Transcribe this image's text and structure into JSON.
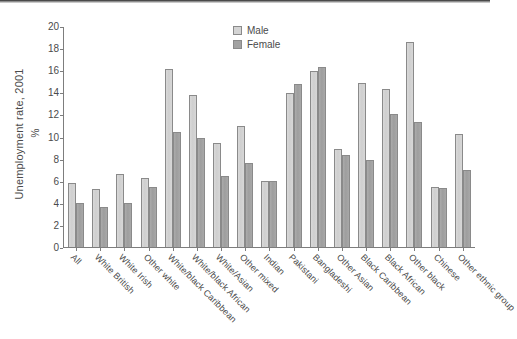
{
  "chart_data": {
    "type": "bar",
    "title": "",
    "subtitle": "",
    "xlabel": "",
    "ylabel": "Unemployment rate, 2001",
    "ylabel_units": "%",
    "ylim": [
      0,
      20
    ],
    "yticks": [
      0,
      2,
      4,
      6,
      8,
      10,
      12,
      14,
      16,
      18,
      20
    ],
    "grid": false,
    "legend_position": "top-right",
    "categories": [
      "All",
      "White British",
      "White Irish",
      "Other white",
      "White/black Caribbean",
      "White/black African",
      "White/Asian",
      "Other mixed",
      "Indian",
      "Pakistani",
      "Bangladeshi",
      "Other Asian",
      "Black Caribbean",
      "Black African",
      "Other black",
      "Chinese",
      "Other ethnic group"
    ],
    "series": [
      {
        "name": "Male",
        "color": "#d4d4d4",
        "values": [
          5.8,
          5.3,
          6.6,
          6.3,
          16.2,
          13.8,
          9.5,
          11.0,
          6.0,
          14.0,
          16.0,
          8.9,
          14.9,
          14.4,
          18.6,
          5.5,
          10.3
        ]
      },
      {
        "name": "Female",
        "color": "#a2a2a2",
        "values": [
          4.0,
          3.6,
          4.0,
          5.5,
          10.5,
          9.9,
          6.5,
          7.6,
          6.0,
          14.8,
          16.4,
          8.4,
          7.9,
          12.1,
          11.4,
          5.4,
          7.0
        ]
      }
    ]
  },
  "legend": {
    "items": [
      {
        "label": "Male",
        "key": "male"
      },
      {
        "label": "Female",
        "key": "female"
      }
    ]
  }
}
